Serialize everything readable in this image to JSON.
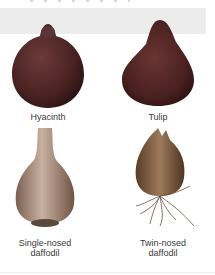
{
  "figure": {
    "bulbs": [
      {
        "id": "hyacinth",
        "label": "Hyacinth",
        "color": "#5a2e2e"
      },
      {
        "id": "tulip",
        "label": "Tulip",
        "color": "#5b2a2a"
      },
      {
        "id": "single-nosed-daffodil",
        "label_line1": "Single-nosed",
        "label_line2": "daffodil",
        "color": "#a98b72"
      },
      {
        "id": "twin-nosed-daffodil",
        "label_line1": "Twin-nosed",
        "label_line2": "daffodil",
        "color": "#7e5a3c"
      }
    ],
    "band_color": "#ececec"
  }
}
